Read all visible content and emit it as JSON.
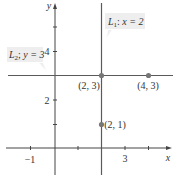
{
  "diagram": {
    "axes": {
      "x_label": "x",
      "y_label": "y",
      "x_ticks": [
        {
          "value": -1,
          "label": "−1"
        },
        {
          "value": 1,
          "label": ""
        },
        {
          "value": 3,
          "label": "3"
        },
        {
          "value": 4,
          "label": ""
        }
      ],
      "y_ticks": [
        {
          "value": 1,
          "label": ""
        },
        {
          "value": 2,
          "label": "2"
        },
        {
          "value": 4,
          "label": "4"
        },
        {
          "value": 5,
          "label": ""
        }
      ]
    },
    "lines": [
      {
        "id": "L1",
        "name": "L",
        "subscript": "1",
        "equation": "x = 2",
        "type": "vertical",
        "value": 2
      },
      {
        "id": "L2",
        "name": "L",
        "subscript": "2",
        "equation": "y = 3",
        "type": "horizontal",
        "value": 3
      }
    ],
    "points": [
      {
        "x": 2,
        "y": 3,
        "label": "(2, 3)"
      },
      {
        "x": 4,
        "y": 3,
        "label": "(4, 3)"
      },
      {
        "x": 2,
        "y": 1,
        "label": "(2, 1)"
      }
    ],
    "colors": {
      "axis": "#444444",
      "line": "#5a5a5a",
      "point": "#777777",
      "callout_fill": "#eeeeee"
    }
  }
}
